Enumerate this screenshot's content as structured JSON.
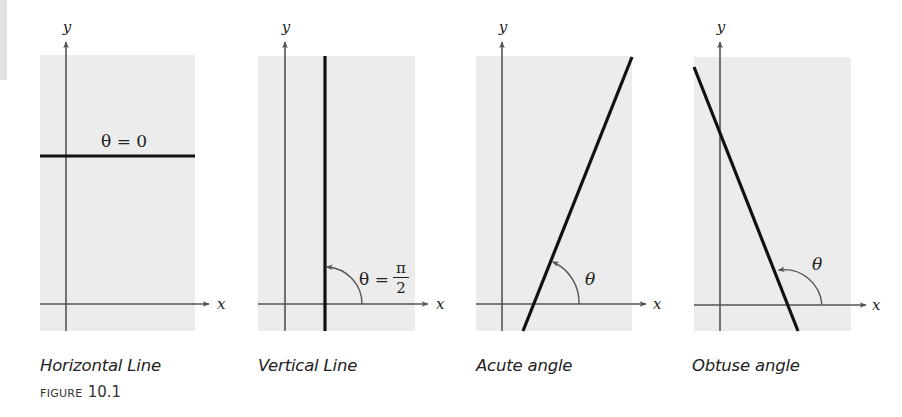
{
  "figure": {
    "label_word": "FIGURE",
    "label_number": "10.1"
  },
  "colors": {
    "panel_background": "#ececec",
    "axis": "#555555",
    "line": "#111111",
    "text": "#222222"
  },
  "panels": [
    {
      "id": "horizontal",
      "caption": "Horizontal Line",
      "x_axis_label": "x",
      "y_axis_label": "y",
      "angle_label": "θ = 0",
      "line_type": "horizontal",
      "inclination_deg": 0
    },
    {
      "id": "vertical",
      "caption": "Vertical Line",
      "x_axis_label": "x",
      "y_axis_label": "y",
      "angle_label_theta": "θ =",
      "angle_label_num": "π",
      "angle_label_den": "2",
      "line_type": "vertical",
      "inclination_deg": 90
    },
    {
      "id": "acute",
      "caption": "Acute angle",
      "x_axis_label": "x",
      "y_axis_label": "y",
      "angle_label": "θ",
      "line_type": "positive-slope",
      "inclination_deg": 68
    },
    {
      "id": "obtuse",
      "caption": "Obtuse angle",
      "x_axis_label": "x",
      "y_axis_label": "y",
      "angle_label": "θ",
      "line_type": "negative-slope",
      "inclination_deg": 113
    }
  ]
}
